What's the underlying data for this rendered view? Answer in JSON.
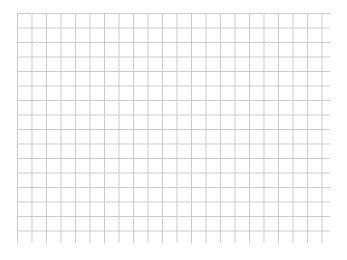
{
  "page": {
    "background_color": "#ffffff",
    "width": 347,
    "height": 260
  },
  "grid": {
    "label": "blank graph paper grid",
    "line_color": "#c9c9c9",
    "line_width_px": 1,
    "fill_color": "#ffffff",
    "origin_x": 17,
    "origin_y": 13,
    "width": 313,
    "height": 230,
    "cell_size_px": 14.5,
    "columns": 21.5,
    "rows": 16,
    "has_major_lines": false,
    "has_axis_labels": false,
    "has_tick_labels": false,
    "has_title": false
  },
  "chart_data": {
    "type": "table",
    "title": "",
    "subtitle": "",
    "xlabel": "",
    "ylabel": "",
    "categories": [],
    "values": [],
    "series": [],
    "annotations": [],
    "legend": [],
    "grid": true,
    "legend_position": "none",
    "xlim": [
      0,
      21.5
    ],
    "ylim": [
      0,
      16
    ],
    "note": "Empty graph-paper grid: no plotted data, no axis tick labels, no legend."
  }
}
